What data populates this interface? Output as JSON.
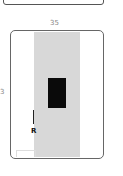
{
  "diagram": {
    "dimension_top": "35",
    "dimension_left": "3",
    "marker_label": "R",
    "colors": {
      "strip": "#d8d8d8",
      "block": "#0a0a0a",
      "outline": "#666666"
    }
  }
}
